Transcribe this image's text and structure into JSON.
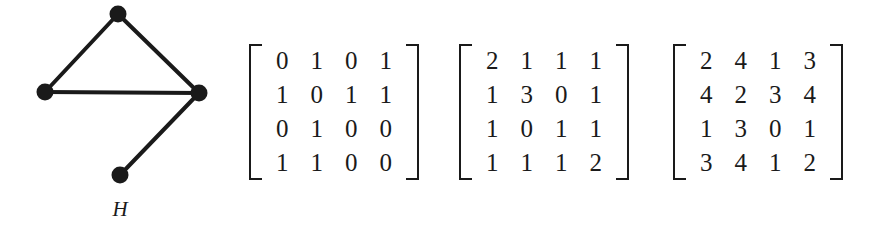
{
  "figure": {
    "background_color": "#ffffff",
    "ink_color": "#1a1a1a"
  },
  "graph": {
    "caption": "H",
    "node_count": 4,
    "nodes": [
      {
        "id": 1,
        "label": "",
        "x": 118,
        "y": 14,
        "r": 8
      },
      {
        "id": 2,
        "label": "",
        "x": 45,
        "y": 92,
        "r": 8
      },
      {
        "id": 3,
        "label": "",
        "x": 199,
        "y": 93,
        "r": 8
      },
      {
        "id": 4,
        "label": "",
        "x": 120,
        "y": 175,
        "r": 8
      }
    ],
    "edges": [
      {
        "from": 1,
        "to": 2
      },
      {
        "from": 1,
        "to": 3
      },
      {
        "from": 2,
        "to": 3
      },
      {
        "from": 3,
        "to": 4
      }
    ]
  },
  "matrices": [
    {
      "name": "matrix-a",
      "label": "A",
      "exponent": "",
      "rows": [
        [
          "0",
          "1",
          "0",
          "1"
        ],
        [
          "1",
          "0",
          "1",
          "1"
        ],
        [
          "0",
          "1",
          "0",
          "0"
        ],
        [
          "1",
          "1",
          "0",
          "0"
        ]
      ]
    },
    {
      "name": "matrix-a2",
      "label": "A",
      "exponent": "2",
      "rows": [
        [
          "2",
          "1",
          "1",
          "1"
        ],
        [
          "1",
          "3",
          "0",
          "1"
        ],
        [
          "1",
          "0",
          "1",
          "1"
        ],
        [
          "1",
          "1",
          "1",
          "2"
        ]
      ]
    },
    {
      "name": "matrix-a3",
      "label": "A",
      "exponent": "3",
      "rows": [
        [
          "2",
          "4",
          "1",
          "3"
        ],
        [
          "4",
          "2",
          "3",
          "4"
        ],
        [
          "1",
          "3",
          "0",
          "1"
        ],
        [
          "3",
          "4",
          "1",
          "2"
        ]
      ]
    }
  ]
}
